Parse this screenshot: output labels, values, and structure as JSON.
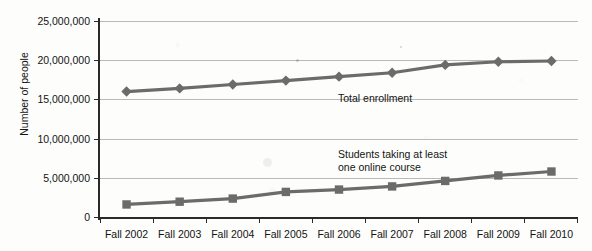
{
  "chart_data": {
    "type": "line",
    "title": "",
    "xlabel": "",
    "ylabel": "Number of people",
    "ylim": [
      0,
      25000000
    ],
    "ytick_labels": [
      "25,000,000",
      "20,000,000",
      "15,000,000",
      "10,000,000",
      "5,000,000",
      "0"
    ],
    "ytick_values": [
      25000000,
      20000000,
      15000000,
      10000000,
      5000000,
      0
    ],
    "grid": true,
    "legend_position": "inline-annotations",
    "categories": [
      "Fall 2002",
      "Fall 2003",
      "Fall 2004",
      "Fall 2005",
      "Fall 2006",
      "Fall 2007",
      "Fall 2008",
      "Fall 2009",
      "Fall 2010"
    ],
    "series": [
      {
        "name": "Total enrollment",
        "marker": "diamond",
        "color": "#6b6b6b",
        "values": [
          16000000,
          16400000,
          16900000,
          17400000,
          17900000,
          18400000,
          19400000,
          19800000,
          19900000
        ]
      },
      {
        "name": "Students taking at least one online course",
        "marker": "square",
        "color": "#6b6b6b",
        "values": [
          1600000,
          1950000,
          2350000,
          3200000,
          3500000,
          3900000,
          4600000,
          5300000,
          5800000
        ]
      }
    ],
    "annotations": [
      {
        "id": "total-enrollment",
        "text": "Total enrollment"
      },
      {
        "id": "online-course",
        "line1": "Students taking at least",
        "line2": "one online course"
      }
    ]
  }
}
